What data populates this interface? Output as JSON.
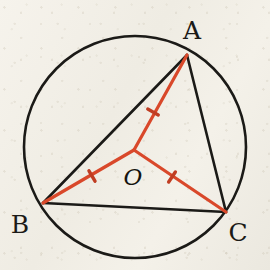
{
  "figure": {
    "caption": "",
    "width": 270,
    "height": 270
  },
  "colors": {
    "paper": "#f2efe7",
    "ink": "#1b1a17",
    "red": "#d9482a",
    "red_dark": "#c03d22"
  },
  "strokes": {
    "circle_width": 2.6,
    "triangle_width": 2.6,
    "radius_width": 3.2,
    "tick_width": 3.4
  },
  "circle": {
    "name": "circumscribed-circle",
    "cx": 135,
    "cy": 147,
    "r": 111
  },
  "center": {
    "name": "center-point-O",
    "label": "O",
    "x": 134,
    "y": 150,
    "label_x": 133,
    "label_y": 177
  },
  "vertices": [
    {
      "label": "A",
      "x": 187,
      "y": 55,
      "label_x": 192,
      "label_y": 30
    },
    {
      "label": "B",
      "x": 43,
      "y": 203,
      "label_x": 20,
      "label_y": 224
    },
    {
      "label": "C",
      "x": 226,
      "y": 212,
      "label_x": 238,
      "label_y": 232
    }
  ],
  "triangle_sides": [
    {
      "name": "side-AB",
      "from": "A",
      "to": "B",
      "x1": 187,
      "y1": 55,
      "x2": 43,
      "y2": 203
    },
    {
      "name": "side-BC",
      "from": "B",
      "to": "C",
      "x1": 43,
      "y1": 203,
      "x2": 226,
      "y2": 212
    },
    {
      "name": "side-CA",
      "from": "C",
      "to": "A",
      "x1": 226,
      "y1": 212,
      "x2": 187,
      "y2": 55
    }
  ],
  "radii": [
    {
      "name": "radius-OA",
      "to": "A",
      "x1": 134,
      "y1": 150,
      "x2": 187,
      "y2": 55,
      "tick": {
        "x": 153,
        "y": 112,
        "angle": -60.8,
        "count": 1
      }
    },
    {
      "name": "radius-OB",
      "to": "B",
      "x1": 134,
      "y1": 150,
      "x2": 43,
      "y2": 203,
      "tick": {
        "x": 92,
        "y": 176,
        "angle": 30.2,
        "count": 1
      }
    },
    {
      "name": "radius-OC",
      "to": "C",
      "x1": 134,
      "y1": 150,
      "x2": 226,
      "y2": 212,
      "tick": {
        "x": 172,
        "y": 177,
        "angle": -34.0,
        "count": 1
      }
    }
  ],
  "chart_data": {
    "type": "diagram",
    "labels": [
      "A",
      "B",
      "C",
      "O"
    ],
    "points": [
      {
        "name": "A",
        "x": 187,
        "y": 55,
        "on_circle": true
      },
      {
        "name": "B",
        "x": 43,
        "y": 203,
        "on_circle": true
      },
      {
        "name": "C",
        "x": 226,
        "y": 212,
        "on_circle": true
      },
      {
        "name": "O",
        "x": 134,
        "y": 150,
        "on_circle": false
      }
    ],
    "segments": [
      {
        "name": "AB",
        "color": "#1b1a17",
        "ticks": 0
      },
      {
        "name": "BC",
        "color": "#1b1a17",
        "ticks": 0
      },
      {
        "name": "CA",
        "color": "#1b1a17",
        "ticks": 0
      },
      {
        "name": "OA",
        "color": "#d9482a",
        "ticks": 1
      },
      {
        "name": "OB",
        "color": "#d9482a",
        "ticks": 1
      },
      {
        "name": "OC",
        "color": "#d9482a",
        "ticks": 1
      }
    ],
    "annotations": [
      "OA = OB = OC (single tick on each radius)"
    ]
  }
}
